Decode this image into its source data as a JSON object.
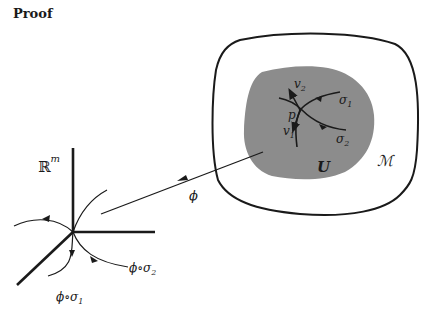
{
  "title": "Proof",
  "manifold": {
    "label": "ℳ",
    "region_label": "U",
    "point_label": "p",
    "vectors": [
      {
        "name": "v",
        "sub": "1"
      },
      {
        "name": "v",
        "sub": "2"
      }
    ],
    "curves": [
      {
        "name": "σ",
        "sub": "1"
      },
      {
        "name": "σ",
        "sub": "2"
      }
    ],
    "colors": {
      "region_fill": "#8c8c8c",
      "stroke": "#1a1a1a"
    }
  },
  "map": {
    "label": "ϕ"
  },
  "euclidean": {
    "base": "ℝ",
    "exponent": "m",
    "image_curves": [
      {
        "label": "ϕ∘σ",
        "sub": "1"
      },
      {
        "label": "ϕ∘σ",
        "sub": "2"
      }
    ]
  }
}
